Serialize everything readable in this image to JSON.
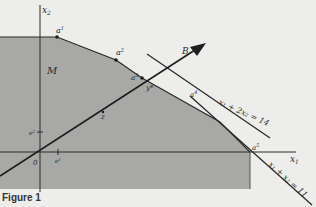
{
  "figure": {
    "caption": "Figure 1",
    "colors": {
      "background": "#ededeb",
      "region_fill": "#a8a8a6",
      "line": "#2a2a2a"
    },
    "axes": {
      "x_label": "x",
      "x_sub": "1",
      "y_label": "x",
      "y_sub": "2",
      "origin_label": "0"
    },
    "region_label": "M",
    "points": [
      {
        "name": "a",
        "sup": "1"
      },
      {
        "name": "a",
        "sup": "2"
      },
      {
        "name": "a",
        "sup": "3"
      },
      {
        "name": "a",
        "sup": "4"
      },
      {
        "name": "a",
        "sup": "5"
      }
    ],
    "axis_points": {
      "e1": {
        "name": "e",
        "sup": "1"
      },
      "e2": {
        "name": "e",
        "sup": "2"
      }
    },
    "vector_label": "B",
    "y_star_label": "y*",
    "z_label": "z",
    "constraints": [
      {
        "label": "x₁ + 2x₂ = 14"
      },
      {
        "label": "x₁ + x₂ = 11"
      }
    ]
  }
}
